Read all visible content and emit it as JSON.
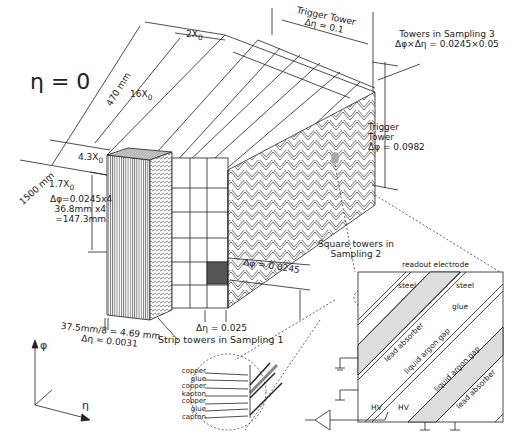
{
  "diagram": {
    "title_eta": "η = 0",
    "dimensions": {
      "mm_1500": "1500 mm",
      "mm_470": "470 mm",
      "x0_2": "2X",
      "x0_16": "16X",
      "x0_43": "4.3X",
      "x0_17": "1.7X",
      "x0_sub": "0"
    },
    "strip_label_lines": [
      "Δφ=0.0245x4",
      "36.8mm x4",
      "=147.3mm"
    ],
    "strip_width_lines": [
      "37.5mm/8 = 4.69 mm",
      "Δη = 0.0031"
    ],
    "trigger_tower_eta": {
      "line1": "Trigger Tower",
      "line2": "Δη = 0.1"
    },
    "sampling3": {
      "line1": "Towers in Sampling 3",
      "line2": "Δφ×Δη = 0.0245×0.05"
    },
    "trigger_tower_phi": {
      "line1": "Trigger",
      "line2": "Tower",
      "line3": "Δφ = 0.0982"
    },
    "delta_phi_sampling2": "Δφ = 0.0245",
    "delta_eta_sampling2": "Δη = 0.025",
    "sampling2_label": {
      "line1": "Square towers in",
      "line2": "Sampling 2"
    },
    "sampling1_label": "Strip towers in Sampling 1",
    "axes": {
      "phi": "φ",
      "eta": "η"
    },
    "electrode_layers": [
      "copper",
      "glue",
      "copper",
      "kapton",
      "copper",
      "glue",
      "capton"
    ],
    "detail_inset": {
      "readout_electrode": "readout electrode",
      "steel_left": "steel",
      "steel_right": "steel",
      "glue": "glue",
      "lead_absorber_1": "lead absorber",
      "lar_gap_1": "liquid argon gap",
      "lar_gap_2": "liquid argon gap",
      "lead_absorber_2": "lead absorber",
      "hv_left": "HV",
      "hv_right": "HV"
    }
  },
  "colors": {
    "line": "#222222",
    "shade_dark": "#555555",
    "shade_light": "#d8d8d8",
    "shade_mid": "#b0b0b0"
  }
}
